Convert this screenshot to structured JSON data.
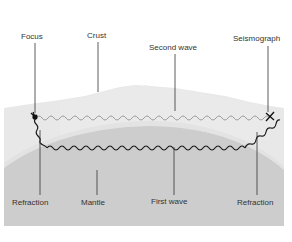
{
  "diagram": {
    "labels": {
      "focus": "Focus",
      "crust": "Crust",
      "second_wave": "Second wave",
      "seismograph": "Seismograph",
      "refraction_left": "Refraction",
      "mantle": "Mantle",
      "first_wave": "First wave",
      "refraction_right": "Refraction"
    },
    "colors": {
      "background": "#ffffff",
      "crust_top": "#ececec",
      "crust_band": "#e4e4e4",
      "mantle": "#cfcfcf",
      "second_wave": "#9a9a9a",
      "first_wave": "#1a1a1a",
      "leader_line": "#333333"
    },
    "icons": {
      "focus_marker": "burst-icon",
      "seismograph_marker": "x-mark-icon"
    }
  }
}
